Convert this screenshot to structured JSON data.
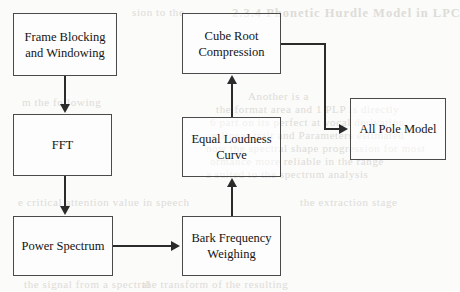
{
  "diagram": {
    "type": "flowchart",
    "nodes": [
      {
        "id": "frame_blocking",
        "label": "Frame Blocking and Windowing",
        "line1": "Frame Blocking",
        "line2": "and Windowing",
        "x": 13,
        "y": 13,
        "w": 104,
        "h": 63
      },
      {
        "id": "fft",
        "label": "FFT",
        "line1": "FFT",
        "line2": "",
        "x": 13,
        "y": 114,
        "w": 99,
        "h": 62
      },
      {
        "id": "power_spectrum",
        "label": "Power Spectrum",
        "line1": "Power Spectrum",
        "line2": "",
        "x": 13,
        "y": 216,
        "w": 100,
        "h": 60
      },
      {
        "id": "bark_frequency",
        "label": "Bark Frequency Weighing",
        "line1": "Bark Frequency",
        "line2": "Weighing",
        "x": 182,
        "y": 216,
        "w": 99,
        "h": 60
      },
      {
        "id": "equal_loudness",
        "label": "Equal Loudness Curve",
        "line1": "Equal Loudness",
        "line2": "Curve",
        "x": 182,
        "y": 117,
        "w": 99,
        "h": 60
      },
      {
        "id": "cube_root",
        "label": "Cube Root Compression",
        "line1": "Cube Root",
        "line2": "Compression",
        "x": 182,
        "y": 13,
        "w": 99,
        "h": 61
      },
      {
        "id": "all_pole",
        "label": "All Pole Model",
        "line1": "All Pole Model",
        "line2": "",
        "x": 350,
        "y": 98,
        "w": 96,
        "h": 62
      }
    ],
    "edges": [
      {
        "id": "e1",
        "from": "frame_blocking",
        "to": "fft",
        "direction": "down"
      },
      {
        "id": "e2",
        "from": "fft",
        "to": "power_spectrum",
        "direction": "down"
      },
      {
        "id": "e3",
        "from": "power_spectrum",
        "to": "bark_frequency",
        "direction": "right"
      },
      {
        "id": "e4",
        "from": "bark_frequency",
        "to": "equal_loudness",
        "direction": "up"
      },
      {
        "id": "e5",
        "from": "equal_loudness",
        "to": "cube_root",
        "direction": "up"
      },
      {
        "id": "e6",
        "from": "cube_root",
        "to": "all_pole",
        "direction": "right-down-right"
      }
    ],
    "colors": {
      "box_border": "#4a4a4a",
      "edge": "#2b2b2b",
      "text": "#141414",
      "background": "#fbfbfa",
      "bleed_text": "#d9d7d2"
    }
  },
  "background_bleed": {
    "note": "faint show-through of text on the reverse side of the scanned page",
    "items": [
      {
        "text": "2.3.4 Phonetic Hurdle Model in LPC",
        "x": 232,
        "y": 6,
        "title": true
      },
      {
        "text": "sion to the",
        "x": 132,
        "y": 6
      },
      {
        "text": "Another is a",
        "x": 248,
        "y": 90
      },
      {
        "text": "the format area and 1 PLP is directly",
        "x": 216,
        "y": 103
      },
      {
        "text": "6 part on its perfect at vocal derivation",
        "x": 210,
        "y": 116
      },
      {
        "text": "g linear trait and Parameters estimated",
        "x": 212,
        "y": 129
      },
      {
        "text": "now the spectral shape progression for most",
        "x": 206,
        "y": 142
      },
      {
        "text": "ormance more reliable in the range",
        "x": 210,
        "y": 155
      },
      {
        "text": "a suited to the spectrum analysis",
        "x": 206,
        "y": 168
      },
      {
        "text": "the extraction stage",
        "x": 300,
        "y": 196
      },
      {
        "text": "e critical attention value in speech",
        "x": 18,
        "y": 196
      },
      {
        "text": "m the following",
        "x": 22,
        "y": 96
      },
      {
        "text": "the transform of the resulting",
        "x": 142,
        "y": 278
      },
      {
        "text": "the signal from a spectral",
        "x": 24,
        "y": 278
      }
    ]
  }
}
